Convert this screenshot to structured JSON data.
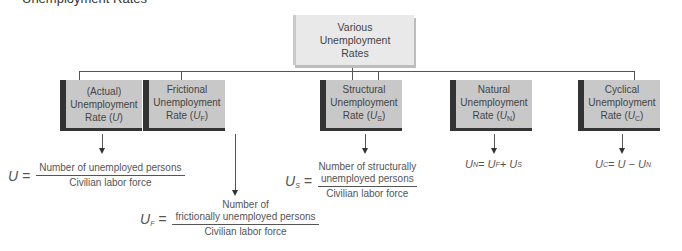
{
  "heading_fragment": "Unemployment Rates",
  "root": {
    "label": "Various Unemployment Rates"
  },
  "nodes": [
    {
      "id": "actual",
      "line1": "(Actual)",
      "line2": "Unemployment",
      "line3": "Rate (",
      "symbol": "U",
      "sub": "",
      "close": ")"
    },
    {
      "id": "frictional",
      "line1": "Frictional",
      "line2": "Unemployment",
      "line3": "Rate (",
      "symbol": "U",
      "sub": "F",
      "close": ")"
    },
    {
      "id": "structural",
      "line1": "Structural",
      "line2": "Unemployment",
      "line3": "Rate (",
      "symbol": "U",
      "sub": "S",
      "close": ")"
    },
    {
      "id": "natural",
      "line1": "Natural",
      "line2": "Unemployment",
      "line3": "Rate (",
      "symbol": "U",
      "sub": "N",
      "close": ")"
    },
    {
      "id": "cyclical",
      "line1": "Cyclical",
      "line2": "Unemployment",
      "line3": "Rate (",
      "symbol": "U",
      "sub": "C",
      "close": ")"
    }
  ],
  "formulas": {
    "actual": {
      "lhs": "U =",
      "numerator": "Number of unemployed persons",
      "denominator": "Civilian labor force"
    },
    "frictional": {
      "lhs_sym": "U",
      "lhs_sub": "F",
      "lhs_eq": " =",
      "numerator_1": "Number of",
      "numerator_2": "frictionally unemployed persons",
      "denominator": "Civilian labor force"
    },
    "structural": {
      "lhs_sym": "U",
      "lhs_sub": "S",
      "lhs_eq": " =",
      "numerator_1": "Number of structurally",
      "numerator_2": "unemployed persons",
      "denominator": "Civilian labor force"
    },
    "natural": {
      "text_1": "U",
      "sub_1": "N",
      "text_2": " = U",
      "sub_2": "F",
      "text_3": " + U",
      "sub_3": "S"
    },
    "cyclical": {
      "text_1": "U",
      "sub_1": "C",
      "text_2": " = U − U",
      "sub_2": "N"
    }
  }
}
